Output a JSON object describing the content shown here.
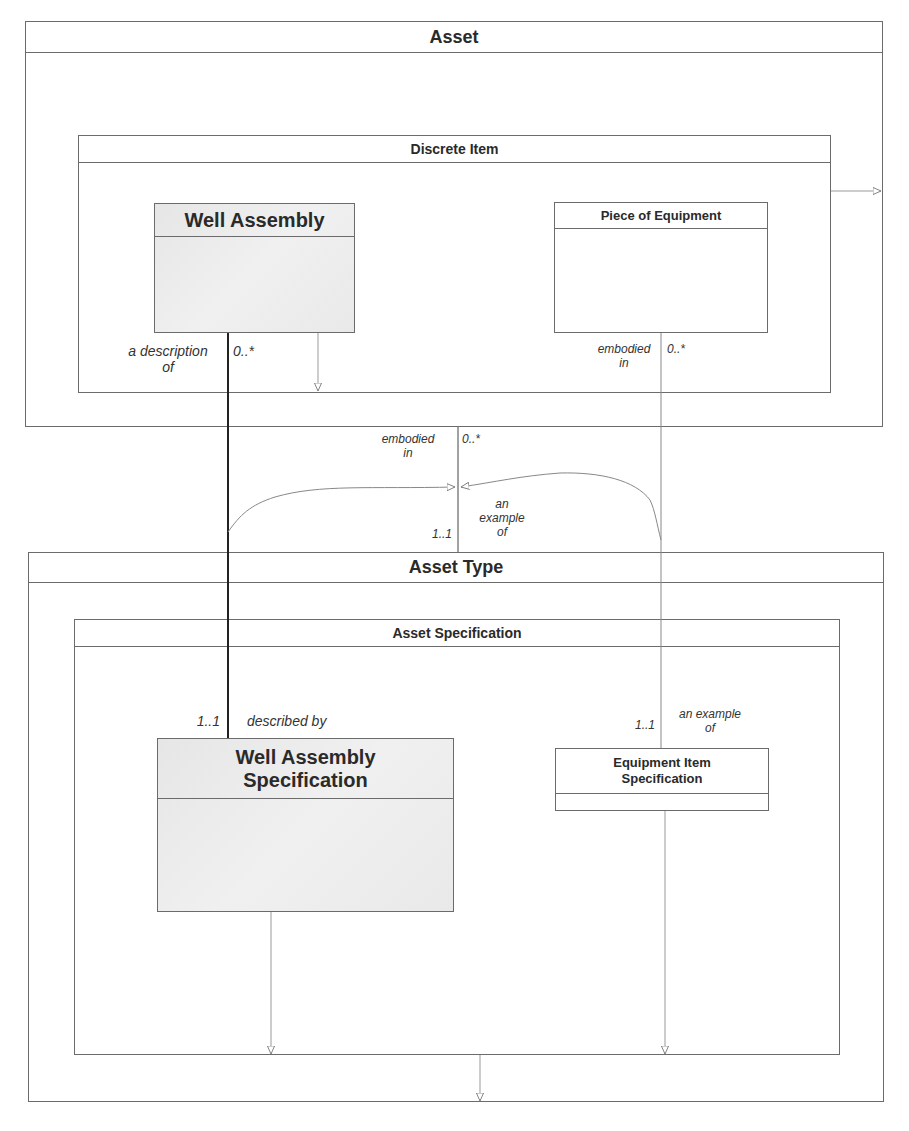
{
  "containers": {
    "asset": {
      "title": "Asset"
    },
    "discrete_item": {
      "title": "Discrete Item"
    },
    "asset_type": {
      "title": "Asset Type"
    },
    "asset_specification": {
      "title": "Asset Specification"
    }
  },
  "classes": {
    "well_assembly": {
      "title": "Well Assembly"
    },
    "piece_of_equipment": {
      "title": "Piece of Equipment"
    },
    "well_assembly_specification": {
      "title_line1": "Well Assembly",
      "title_line2": "Specification"
    },
    "equipment_item_specification": {
      "title_line1": "Equipment Item",
      "title_line2": "Specification"
    }
  },
  "associations": {
    "well_assembly_link": {
      "top_role_line1": "a description",
      "top_role_line2": "of",
      "top_multiplicity": "0..*",
      "bottom_multiplicity": "1..1",
      "bottom_role": "described by"
    },
    "equipment_link": {
      "top_role_line1": "embodied",
      "top_role_line2": "in",
      "top_multiplicity": "0..*",
      "bottom_multiplicity": "1..1",
      "bottom_role_line1": "an example",
      "bottom_role_line2": "of"
    },
    "asset_link": {
      "top_role_line1": "embodied",
      "top_role_line2": "in",
      "top_multiplicity": "0..*",
      "bottom_multiplicity": "1..1",
      "bottom_role_line1": "an",
      "bottom_role_line2": "example",
      "bottom_role_line3": "of"
    }
  },
  "colors": {
    "line": "#6b6b6b",
    "strong_line": "#222222",
    "shade": "#e8e8e8"
  }
}
